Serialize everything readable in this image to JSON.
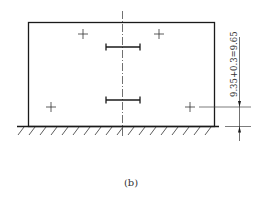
{
  "diagram": {
    "dimension_label": "9.35+0.3=9.65",
    "caption": "(b)",
    "colors": {
      "line": "#1a1a1a",
      "background": "#ffffff"
    }
  }
}
